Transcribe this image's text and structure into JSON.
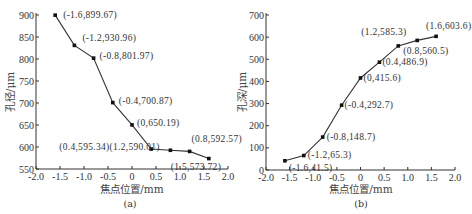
{
  "chart_data": [
    {
      "id": "a",
      "type": "line",
      "title": "",
      "caption": "(a)",
      "xlabel": "焦点位置/mm",
      "ylabel": "孔径/μm",
      "xlim": [
        -2.0,
        2.0
      ],
      "ylim": [
        550,
        900
      ],
      "xticks": [
        "-2.0",
        "-1.5",
        "-1.0",
        "-0.5",
        "0",
        "0.5",
        "1.0",
        "1.5",
        "2.0"
      ],
      "yticks": [
        "550",
        "600",
        "650",
        "700",
        "750",
        "800",
        "850",
        "900"
      ],
      "grid": false,
      "legend": null,
      "series": [
        {
          "name": "孔径",
          "x": [
            -1.6,
            -1.2,
            -0.8,
            -0.4,
            0,
            0.4,
            0.8,
            1.2,
            1.6
          ],
          "values": [
            899.67,
            830.96,
            801.97,
            700.87,
            650.19,
            595.34,
            592.57,
            590.01,
            573.72
          ]
        }
      ],
      "annotations": [
        {
          "text": "(-1.6,899.67)",
          "x": -1.6,
          "y": 899.67
        },
        {
          "text": "(-1.2,930.96)",
          "x": -1.2,
          "y": 830.96
        },
        {
          "text": "(-0.8,801.97)",
          "x": -0.8,
          "y": 801.97
        },
        {
          "text": "(-0.4,700.87)",
          "x": -0.4,
          "y": 700.87
        },
        {
          "text": "(0,650.19)",
          "x": 0,
          "y": 650.19
        },
        {
          "text": "(0.4,595.34)(1.2,590.01)",
          "x": 0.4,
          "y": 595.34
        },
        {
          "text": "(0.8,592.57)",
          "x": 1.2,
          "y": 590.01
        },
        {
          "text": "(1.5,573.72)",
          "x": 1.6,
          "y": 573.72
        }
      ]
    },
    {
      "id": "b",
      "type": "line",
      "title": "",
      "caption": "(b)",
      "xlabel": "焦点位置/mm",
      "ylabel": "孔深/μm",
      "xlim": [
        -2.0,
        2.0
      ],
      "ylim": [
        0,
        700
      ],
      "xticks": [
        "-2.0",
        "-1.5",
        "-1.0",
        "-0.5",
        "0",
        "0.5",
        "1.0",
        "1.5",
        "2.0"
      ],
      "yticks": [
        "0",
        "100",
        "200",
        "300",
        "400",
        "500",
        "600",
        "700"
      ],
      "grid": false,
      "legend": null,
      "series": [
        {
          "name": "孔深",
          "x": [
            -1.6,
            -1.2,
            -0.8,
            -0.4,
            0,
            0.4,
            0.8,
            1.2,
            1.6
          ],
          "values": [
            41.5,
            65.3,
            148.7,
            292.7,
            415.6,
            486.9,
            560.5,
            585.3,
            603.6
          ]
        }
      ],
      "annotations": [
        {
          "text": "(-1.6,41.5)",
          "x": -1.6,
          "y": 41.5
        },
        {
          "text": "(-1.2,65.3)",
          "x": -1.2,
          "y": 65.3
        },
        {
          "text": "(-0.8,148.7)",
          "x": -0.8,
          "y": 148.7
        },
        {
          "text": "(-0.4,292.7)",
          "x": -0.4,
          "y": 292.7
        },
        {
          "text": "(0,415.6)",
          "x": 0,
          "y": 415.6
        },
        {
          "text": "(0.4,486.9)",
          "x": 0.4,
          "y": 486.9
        },
        {
          "text": "(0.8,560.5)",
          "x": 0.8,
          "y": 560.5
        },
        {
          "text": "(1.2,585.3)",
          "x": 1.2,
          "y": 585.3
        },
        {
          "text": "(1.6,603.6)",
          "x": 1.6,
          "y": 603.6
        }
      ]
    }
  ]
}
